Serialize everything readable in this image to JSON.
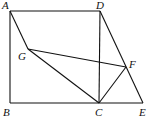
{
  "diagram": {
    "points": {
      "A": {
        "label": "A",
        "x": 10,
        "y": 11,
        "lx": 2,
        "ly": 9
      },
      "D": {
        "label": "D",
        "x": 100,
        "y": 11,
        "lx": 96,
        "ly": 9
      },
      "G": {
        "label": "G",
        "x": 28,
        "y": 49,
        "lx": 18,
        "ly": 60
      },
      "F": {
        "label": "F",
        "x": 126,
        "y": 67,
        "lx": 129,
        "ly": 68
      },
      "B": {
        "label": "B",
        "x": 10,
        "y": 103,
        "lx": 3,
        "ly": 116
      },
      "C": {
        "label": "C",
        "x": 99,
        "y": 103,
        "lx": 95,
        "ly": 116
      },
      "E": {
        "label": "E",
        "x": 143,
        "y": 103,
        "lx": 139,
        "ly": 116
      }
    },
    "segments": [
      [
        "A",
        "D"
      ],
      [
        "A",
        "B"
      ],
      [
        "B",
        "E"
      ],
      [
        "D",
        "C"
      ],
      [
        "D",
        "E"
      ],
      [
        "A",
        "G"
      ],
      [
        "G",
        "C"
      ],
      [
        "G",
        "F"
      ],
      [
        "F",
        "C"
      ]
    ]
  }
}
